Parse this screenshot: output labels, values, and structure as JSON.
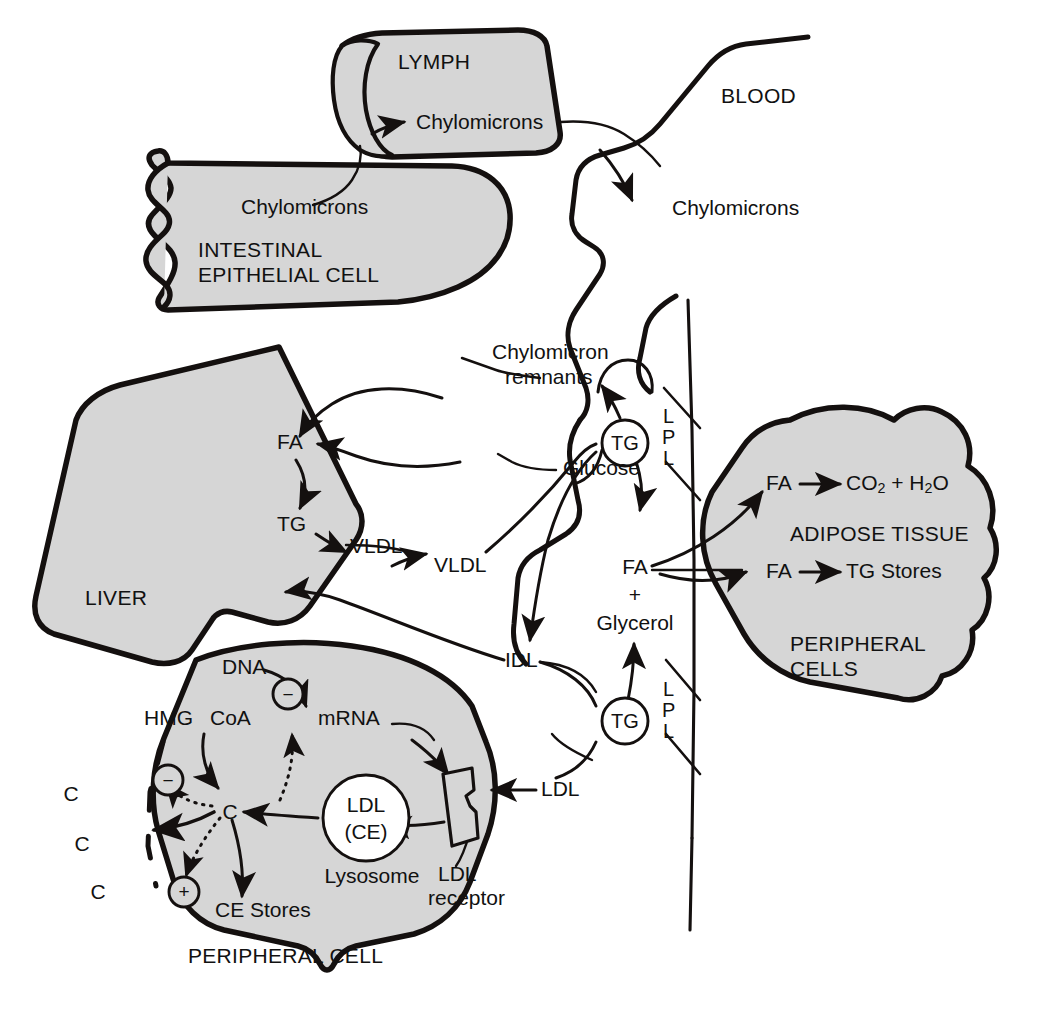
{
  "diagram": {
    "colors": {
      "cell_fill": "#d6d6d6",
      "stroke": "#14100f",
      "background": "#ffffff"
    }
  },
  "compartments": {
    "lymph": "LYMPH",
    "blood": "BLOOD",
    "intestinal_cell": "INTESTINAL\nEPITHELIAL CELL",
    "intestinal_cell_line1": "INTESTINAL",
    "intestinal_cell_line2": "EPITHELIAL CELL",
    "liver": "LIVER",
    "peripheral_cell": "PERIPHERAL CELL",
    "peripheral_cells_line1": "PERIPHERAL",
    "peripheral_cells_line2": "CELLS"
  },
  "labels": {
    "chylomicrons_intestine": "Chylomicrons",
    "chylomicrons_lymph": "Chylomicrons",
    "chylomicrons_blood": "Chylomicrons",
    "chylomicron_remnants_line1": "Chylomicron",
    "chylomicron_remnants_line2": "remnants",
    "glucose": "Glucose",
    "liver_fa": "FA",
    "liver_tg": "TG",
    "liver_vldl": "VLDL",
    "blood_vldl": "VLDL",
    "idl": "IDL",
    "ldl": "LDL",
    "tg_circle_upper": "TG",
    "tg_circle_lower": "TG",
    "fa_blood": "FA",
    "plus_blood": "+",
    "glycerol": "Glycerol",
    "lpl_upper": "L\nP\nL",
    "lpl_lower": "L\nP\nL",
    "lpl_letters": [
      "L",
      "P",
      "L"
    ],
    "muscle": "MUSCLE",
    "muscle_fa": "FA",
    "muscle_products": "CO2 + H2O",
    "adipose": "ADIPOSE TISSUE",
    "adipose_fa": "FA",
    "adipose_products": "TG Stores",
    "dna": "DNA",
    "mrna": "mRNA",
    "hmg": "HMG",
    "coa": "CoA",
    "cholesterol_c": "C",
    "membrane_c_1": "C",
    "membrane_c_2": "C",
    "membrane_c_3": "C",
    "ldl_particle_line1": "LDL",
    "ldl_particle_line2": "(CE)",
    "lysosome": "Lysosome",
    "ldl_receptor_line1": "LDL",
    "ldl_receptor_line2": "receptor",
    "ce_stores": "CE Stores",
    "minus_sign": "−",
    "plus_sign": "+"
  },
  "regulation": {
    "minus_dna": "−",
    "minus_hmg": "−",
    "plus_ce": "+"
  }
}
